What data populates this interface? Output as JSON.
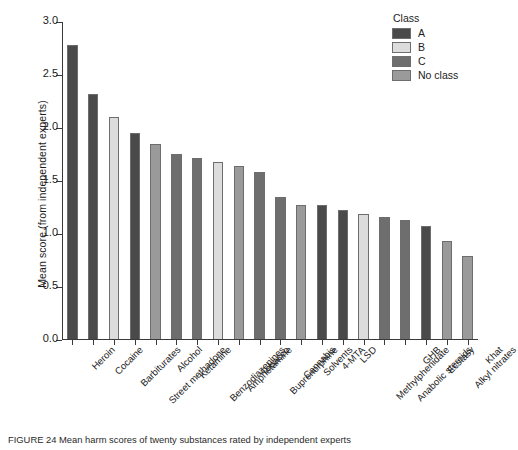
{
  "chart_data": {
    "type": "bar",
    "title": "",
    "xlabel": "",
    "ylabel": "Mean score (from independent experts)",
    "ylim": [
      0.0,
      3.0
    ],
    "ytick_labels": [
      "0.0",
      "0.5",
      "1.0",
      "1.5",
      "2.0",
      "2.5",
      "3.0"
    ],
    "ytick_values": [
      0.0,
      0.5,
      1.0,
      1.5,
      2.0,
      2.5,
      3.0
    ],
    "grid": false,
    "legend_position": "top-right",
    "categories": [
      "Heroin",
      "Cocaine",
      "Barbiturates",
      "Street methadone",
      "Alcohol",
      "Ketamine",
      "Benzodiazepines",
      "Amphetamine",
      "Tobacco",
      "Buprenorphine",
      "Cannabis",
      "Solvents",
      "4-MTA",
      "LSD",
      "Methylphenidate",
      "Anabolic steroids",
      "GHB",
      "Ecstasy",
      "Alkyl nitrates",
      "Khat"
    ],
    "values": [
      2.77,
      2.31,
      2.09,
      1.94,
      1.84,
      1.75,
      1.71,
      1.67,
      1.63,
      1.58,
      1.34,
      1.26,
      1.26,
      1.22,
      1.18,
      1.15,
      1.12,
      1.07,
      0.92,
      0.78
    ],
    "classes": [
      "A",
      "A",
      "B",
      "A",
      "No class",
      "C",
      "C",
      "B",
      "No class",
      "C",
      "C",
      "No class",
      "A",
      "A",
      "B",
      "C",
      "C",
      "A",
      "No class",
      "No class"
    ],
    "legend": {
      "title": "Class",
      "entries": [
        {
          "label": "A",
          "color": "#4a4a4a"
        },
        {
          "label": "B",
          "color": "#dcdcdc"
        },
        {
          "label": "C",
          "color": "#6e6e6e"
        },
        {
          "label": "No class",
          "color": "#9a9a9a"
        }
      ]
    },
    "class_colors": {
      "A": "#4a4a4a",
      "B": "#dcdcdc",
      "C": "#6e6e6e",
      "No class": "#9a9a9a"
    }
  },
  "caption": "FIGURE 24 Mean harm scores of twenty substances rated by independent experts"
}
